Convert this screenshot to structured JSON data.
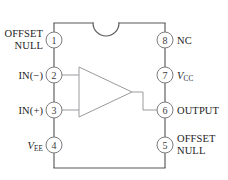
{
  "diagram": {
    "package": {
      "notch": "semicircular-notch-top",
      "body_outline": "rectangle-with-top-notch"
    },
    "colors": {
      "outline": "#59595c",
      "pin_circle_stroke": "#7d7d80",
      "triangle": "#9a9a9e",
      "text": "#1c1c1c",
      "pin_number_text": "#3c3c3c",
      "background": "#ffffff"
    },
    "pins": [
      {
        "number": "1",
        "side": "left",
        "label_line1": "OFFSET",
        "label_line2": "NULL",
        "label_plain": "OFFSET NULL"
      },
      {
        "number": "2",
        "side": "left",
        "label_line1": "IN(−)",
        "label_line2": "",
        "label_plain": "IN(-)"
      },
      {
        "number": "3",
        "side": "left",
        "label_line1": "IN(+)",
        "label_line2": "",
        "label_plain": "IN(+)"
      },
      {
        "number": "4",
        "side": "left",
        "label_line1": "V",
        "label_sub": "EE",
        "label_line2": "",
        "label_plain": "VEE"
      },
      {
        "number": "5",
        "side": "right",
        "label_line1": "OFFSET",
        "label_line2": "NULL",
        "label_plain": "OFFSET NULL"
      },
      {
        "number": "6",
        "side": "right",
        "label_line1": "OUTPUT",
        "label_line2": "",
        "label_plain": "OUTPUT"
      },
      {
        "number": "7",
        "side": "right",
        "label_line1": "V",
        "label_sub": "CC",
        "label_line2": "",
        "label_plain": "VCC"
      },
      {
        "number": "8",
        "side": "right",
        "label_line1": "NC",
        "label_line2": "",
        "label_plain": "NC"
      }
    ],
    "internal_symbol": {
      "type": "triangle-amplifier",
      "inputs": [
        "2",
        "3"
      ],
      "output": "6"
    }
  }
}
